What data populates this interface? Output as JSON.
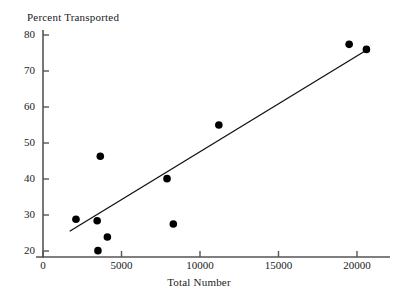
{
  "chart_data": {
    "type": "scatter",
    "title": "",
    "xlabel": "Total Number",
    "ylabel": "Percent Transported",
    "xlim": [
      0,
      22200
    ],
    "ylim": [
      18,
      81
    ],
    "grid": false,
    "legend": false,
    "xticks": [
      0,
      5000,
      10000,
      15000,
      20000
    ],
    "xtick_labels": [
      "0",
      "5000",
      "10000",
      "15000",
      "20000"
    ],
    "yticks": [
      20,
      30,
      40,
      50,
      60,
      70,
      80
    ],
    "ytick_labels": [
      "20",
      "30",
      "40",
      "50",
      "60",
      "70",
      "80"
    ],
    "marker": "filled-circle",
    "marker_color": "#000000",
    "marker_size_px": 5.4,
    "points": [
      {
        "x": 2100,
        "y": 28.8
      },
      {
        "x": 3450,
        "y": 28.4
      },
      {
        "x": 3500,
        "y": 20.1
      },
      {
        "x": 3650,
        "y": 46.3
      },
      {
        "x": 4100,
        "y": 23.9
      },
      {
        "x": 7900,
        "y": 40.1
      },
      {
        "x": 8300,
        "y": 27.5
      },
      {
        "x": 11200,
        "y": 55.0
      },
      {
        "x": 19500,
        "y": 77.4
      },
      {
        "x": 20600,
        "y": 76.0
      }
    ],
    "series": [
      {
        "name": "observations",
        "type": "scatter",
        "x": [
          2100,
          3450,
          3500,
          3650,
          4100,
          7900,
          8300,
          11200,
          19500,
          20600
        ],
        "values": [
          28.8,
          28.4,
          20.1,
          46.3,
          23.9,
          40.1,
          27.5,
          55.0,
          77.4,
          76.0
        ]
      },
      {
        "name": "fitted-line",
        "type": "line",
        "color": "#000000",
        "x": [
          1700,
          20800
        ],
        "values": [
          25.5,
          76.3
        ]
      }
    ],
    "trendline": {
      "x_start": 1700,
      "y_start": 25.5,
      "x_end": 20800,
      "y_end": 76.3,
      "slope_per_unit": 0.00266,
      "intercept": 20.98
    },
    "axes": {
      "spine_color": "#555555",
      "tick_direction": "in",
      "left_spine": true,
      "bottom_spine": true,
      "top_spine": false,
      "right_spine": false
    }
  },
  "figure": {
    "background_color": "#ffffff",
    "foreground_color": "#1a1a1a"
  }
}
